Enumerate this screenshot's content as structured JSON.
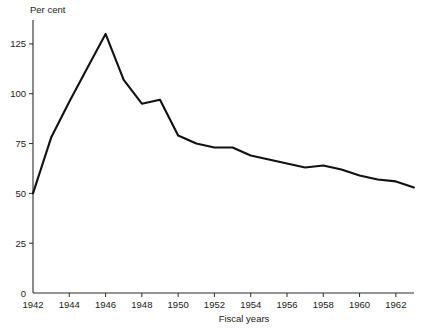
{
  "chart_data": {
    "type": "line",
    "title": "",
    "xlabel": "Fiscal years",
    "ylabel": "Per cent",
    "xlim": [
      1942,
      1963
    ],
    "ylim": [
      0,
      137
    ],
    "grid": false,
    "legend": "none",
    "x_ticks": [
      1942,
      1944,
      1946,
      1948,
      1950,
      1952,
      1954,
      1956,
      1958,
      1960,
      1962
    ],
    "x_tick_labels": [
      "1942",
      "1944",
      "1946",
      "1948",
      "1950",
      "1952",
      "1954",
      "1956",
      "1958",
      "1960",
      "1962"
    ],
    "y_ticks": [
      0,
      25,
      50,
      75,
      100,
      125
    ],
    "y_tick_labels": [
      "0",
      "25",
      "50",
      "75",
      "100",
      "125"
    ],
    "series": [
      {
        "name": "Per cent",
        "color": "#111111",
        "x": [
          1942,
          1943,
          1944,
          1945,
          1946,
          1947,
          1948,
          1949,
          1950,
          1951,
          1952,
          1953,
          1954,
          1955,
          1956,
          1957,
          1958,
          1959,
          1960,
          1961,
          1962,
          1963
        ],
        "values": [
          50,
          78,
          96,
          113,
          130,
          107,
          95,
          97,
          79,
          75,
          73,
          73,
          69,
          67,
          65,
          63,
          64,
          62,
          59,
          57,
          56,
          53
        ]
      }
    ]
  },
  "axis": {
    "y_title": "Per cent",
    "x_title": "Fiscal years"
  }
}
